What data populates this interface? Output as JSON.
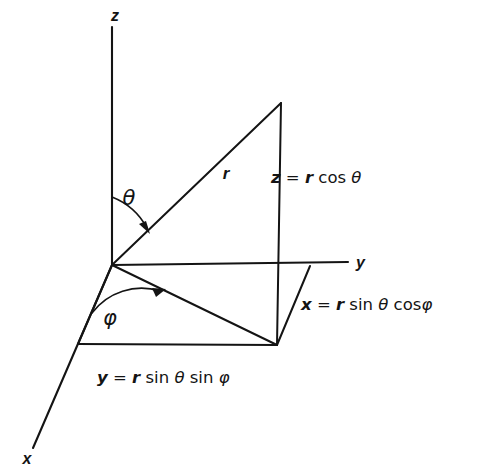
{
  "figure": {
    "type": "spherical-coordinates-diagram",
    "background_color": "#ffffff",
    "ink_color": "#141414",
    "axes": [
      {
        "name": "z-axis",
        "label": "z",
        "label_x": 115,
        "label_y": 21,
        "from": [
          112,
          265
        ],
        "to": [
          112,
          27
        ]
      },
      {
        "name": "y-axis",
        "label": "y",
        "label_x": 356,
        "label_y": 268,
        "from": [
          112,
          265
        ],
        "to": [
          348,
          262
        ]
      },
      {
        "name": "x-axis",
        "label": "x",
        "label_x": 27,
        "label_y": 464,
        "from": [
          112,
          265
        ],
        "to": [
          33,
          448
        ]
      }
    ],
    "labels": {
      "z_axis_label": "z",
      "y_axis_label": "y",
      "x_axis_label": "x",
      "radius_label": "r",
      "theta_label": "θ",
      "phi_label": "φ"
    },
    "equations": {
      "z": {
        "lhs": "z",
        "eq": " = ",
        "rhs_pre": "r",
        "rhs_fn": " cos ",
        "rhs_greek": "θ",
        "full": "z = r cos θ",
        "x": 271,
        "y": 183
      },
      "x": {
        "lhs": "x",
        "eq": " = ",
        "rhs_pre": "r",
        "rhs_fn": " sin ",
        "rhs_greek": "θ",
        "rhs_fn2": " cos",
        "rhs_greek2": "φ",
        "full": "x = r sin θ cosφ",
        "x": 301,
        "y": 310
      },
      "y": {
        "lhs": "y",
        "eq": " = ",
        "rhs_pre": "r",
        "rhs_fn": " sin ",
        "rhs_greek": "θ",
        "rhs_fn2": " sin ",
        "rhs_greek2": "φ",
        "full": "y = r sin θ sin φ",
        "x": 97,
        "y": 383
      }
    },
    "points": {
      "origin": [
        112,
        265
      ],
      "point_P": [
        281,
        103
      ],
      "projection_xy": [
        277,
        345
      ],
      "y_plane_corner": [
        310,
        266
      ],
      "x_plane_corner": [
        78,
        344
      ]
    },
    "segments": [
      {
        "name": "radius-ray",
        "from": [
          112,
          265
        ],
        "to": [
          281,
          103
        ]
      },
      {
        "name": "z-component-drop",
        "from": [
          281,
          103
        ],
        "to": [
          277,
          345
        ]
      },
      {
        "name": "vertical-plane-top-edge",
        "from": [
          112,
          265
        ],
        "to": [
          281,
          103
        ]
      },
      {
        "name": "xy-projection-ray",
        "from": [
          112,
          265
        ],
        "to": [
          277,
          345
        ]
      },
      {
        "name": "plane-edge-origin-to-x",
        "from": [
          112,
          265
        ],
        "to": [
          78,
          344
        ]
      },
      {
        "name": "plane-edge-bottom",
        "from": [
          78,
          344
        ],
        "to": [
          277,
          345
        ]
      },
      {
        "name": "plane-edge-right",
        "from": [
          277,
          345
        ],
        "to": [
          310,
          266
        ]
      }
    ],
    "angles": [
      {
        "name": "theta-angle",
        "label": "θ",
        "label_x": 129,
        "label_y": 205,
        "vertex": [
          112,
          265
        ],
        "between": [
          "z-axis",
          "radius-ray"
        ]
      },
      {
        "name": "phi-angle",
        "label": "φ",
        "label_x": 110,
        "label_y": 325,
        "vertex": [
          112,
          265
        ],
        "between": [
          "x-axis",
          "xy-projection-ray"
        ]
      }
    ]
  }
}
